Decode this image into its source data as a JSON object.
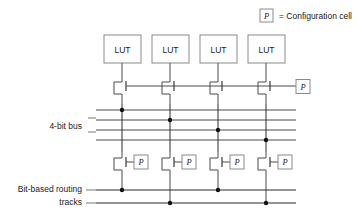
{
  "figure": {
    "legend": {
      "cell_symbol": "P",
      "equals_text": "= Configuration cell"
    },
    "labels": {
      "bus": "4-bit bus",
      "tracks_line1": "Bit-based routing",
      "tracks_line2": "tracks"
    },
    "colors": {
      "wire": "#4a4a4a",
      "wire_dark": "#2b2b2b",
      "box_border": "#8a8a8a",
      "text": "#1a1a1a",
      "dot": "#111111",
      "background": "#ffffff"
    },
    "luts": [
      {
        "label": "LUT",
        "x": 122
      },
      {
        "label": "LUT",
        "x": 170
      },
      {
        "label": "LUT",
        "x": 218
      },
      {
        "label": "LUT",
        "x": 266
      }
    ],
    "upper_config_cell": {
      "label": "P"
    },
    "lower_config_cells": [
      {
        "label": "P"
      },
      {
        "label": "P"
      },
      {
        "label": "P"
      },
      {
        "label": "P"
      }
    ],
    "bus": {
      "line_count": 4,
      "y_positions": [
        110,
        120,
        130,
        140
      ],
      "connections": [
        {
          "column": 1,
          "line": 1
        },
        {
          "column": 2,
          "line": 2
        },
        {
          "column": 3,
          "line": 3
        },
        {
          "column": 4,
          "line": 4
        }
      ]
    },
    "routing_tracks": {
      "line_count": 2,
      "y_positions": [
        190,
        203
      ],
      "connections": [
        {
          "column": 1,
          "line": 1
        },
        {
          "column": 2,
          "line": 2
        },
        {
          "column": 3,
          "line": 1
        },
        {
          "column": 4,
          "line": 2
        }
      ]
    }
  }
}
